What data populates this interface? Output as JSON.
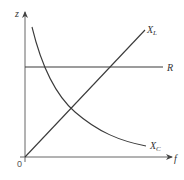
{
  "diagram": {
    "axes": {
      "y_label": "z",
      "x_label": "f",
      "origin_label": "0"
    },
    "curves": [
      {
        "id": "R",
        "label": "R",
        "shape": "horizontal line",
        "description": "constant resistance"
      },
      {
        "id": "XL",
        "label": "X",
        "subscript": "L",
        "shape": "straight line through origin",
        "description": "inductive reactance increasing with f"
      },
      {
        "id": "XC",
        "label": "X",
        "subscript": "C",
        "shape": "hyperbola",
        "description": "capacitive reactance decreasing with f"
      }
    ],
    "colors": {
      "axis": "#555555",
      "curve": "#3a3a3a",
      "background": "#ffffff"
    }
  }
}
